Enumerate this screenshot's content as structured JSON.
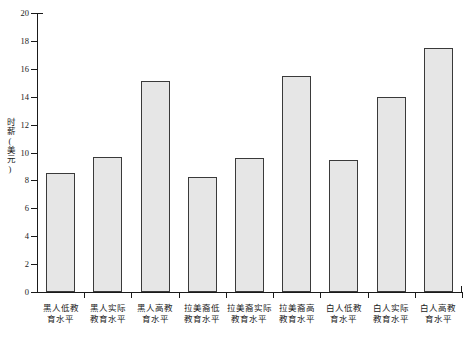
{
  "chart_data": {
    "type": "bar",
    "title": "",
    "subtitle": "",
    "xlabel": "",
    "ylabel": "时薪(美元)",
    "ylim": [
      0,
      20
    ],
    "yticks": [
      0,
      2,
      4,
      6,
      8,
      10,
      12,
      14,
      16,
      18,
      20
    ],
    "grid": false,
    "legend": null,
    "bar_fill_color": "#e6e6e6",
    "bar_edge_color": "#3a3a3a",
    "axis_color": "#1a1a1a",
    "categories": [
      "黑人低教育水平",
      "黑人实际教育水平",
      "黑人高教育水平",
      "拉美裔低教育水平",
      "拉美裔实际教育水平",
      "拉美裔高教育水平",
      "白人低教育水平",
      "白人实际教育水平",
      "白人高教育水平"
    ],
    "category_lines": [
      [
        "黑人低教",
        "育水平"
      ],
      [
        "黑人实际",
        "教育水平"
      ],
      [
        "黑人高教",
        "育水平"
      ],
      [
        "拉美裔低",
        "教育水平"
      ],
      [
        "拉美裔实际",
        "教育水平"
      ],
      [
        "拉美裔高",
        "教育水平"
      ],
      [
        "白人低教",
        "育水平"
      ],
      [
        "白人实际",
        "教育水平"
      ],
      [
        "白人高教",
        "育水平"
      ]
    ],
    "values": [
      8.55,
      9.65,
      15.15,
      8.25,
      9.6,
      15.5,
      9.45,
      13.95,
      17.5
    ]
  }
}
